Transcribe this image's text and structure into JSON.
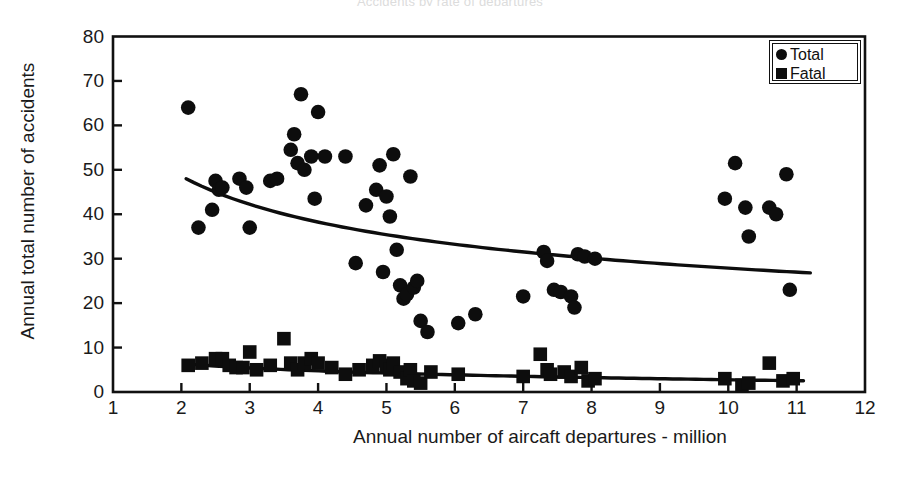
{
  "figure": {
    "ghost_title": "Accidents by rate of departures",
    "background": "#ffffff",
    "ink": "#111111"
  },
  "legend": {
    "position": "top-right",
    "entries": [
      {
        "label": "Total",
        "marker": "circle",
        "color": "#0d0d0d"
      },
      {
        "label": "Fatal",
        "marker": "square",
        "color": "#0d0d0d"
      }
    ]
  },
  "chart_data": {
    "type": "scatter",
    "title": "",
    "xlabel": "Annual number of aircaft departures - million",
    "ylabel": "Annual total number of accidents",
    "xlim": [
      1,
      12
    ],
    "ylim": [
      0,
      80
    ],
    "xticks": [
      1,
      2,
      3,
      4,
      5,
      6,
      7,
      8,
      9,
      10,
      11,
      12
    ],
    "yticks": [
      0,
      10,
      20,
      30,
      40,
      50,
      60,
      70,
      80
    ],
    "grid": false,
    "legend_position": "top-right",
    "series": [
      {
        "name": "Total",
        "marker": "circle",
        "color": "#0d0d0d",
        "points": [
          [
            2.1,
            64.0
          ],
          [
            2.25,
            37.0
          ],
          [
            2.5,
            47.5
          ],
          [
            2.55,
            45.5
          ],
          [
            2.6,
            46.0
          ],
          [
            2.45,
            41.0
          ],
          [
            2.85,
            48.0
          ],
          [
            2.95,
            46.0
          ],
          [
            3.0,
            37.0
          ],
          [
            3.3,
            47.5
          ],
          [
            3.4,
            48.0
          ],
          [
            3.6,
            54.5
          ],
          [
            3.65,
            58.0
          ],
          [
            3.7,
            51.5
          ],
          [
            3.75,
            67.0
          ],
          [
            3.8,
            50.0
          ],
          [
            3.9,
            53.0
          ],
          [
            3.95,
            43.5
          ],
          [
            4.0,
            63.0
          ],
          [
            4.1,
            53.0
          ],
          [
            4.4,
            53.0
          ],
          [
            4.55,
            29.0
          ],
          [
            4.7,
            42.0
          ],
          [
            4.85,
            45.5
          ],
          [
            4.9,
            51.0
          ],
          [
            4.95,
            27.0
          ],
          [
            5.0,
            44.0
          ],
          [
            5.05,
            39.5
          ],
          [
            5.1,
            53.5
          ],
          [
            5.15,
            32.0
          ],
          [
            5.2,
            24.0
          ],
          [
            5.25,
            21.0
          ],
          [
            5.3,
            22.0
          ],
          [
            5.35,
            48.5
          ],
          [
            5.4,
            23.5
          ],
          [
            5.45,
            25.0
          ],
          [
            5.5,
            16.0
          ],
          [
            5.6,
            13.5
          ],
          [
            6.05,
            15.5
          ],
          [
            6.3,
            17.5
          ],
          [
            7.0,
            21.5
          ],
          [
            7.3,
            31.5
          ],
          [
            7.35,
            29.5
          ],
          [
            7.45,
            23.0
          ],
          [
            7.55,
            22.5
          ],
          [
            7.7,
            21.5
          ],
          [
            7.75,
            19.0
          ],
          [
            7.8,
            31.0
          ],
          [
            7.9,
            30.5
          ],
          [
            8.05,
            30.0
          ],
          [
            9.95,
            43.5
          ],
          [
            10.1,
            51.5
          ],
          [
            10.25,
            41.5
          ],
          [
            10.3,
            35.0
          ],
          [
            10.6,
            41.5
          ],
          [
            10.7,
            40.0
          ],
          [
            10.85,
            49.0
          ],
          [
            10.9,
            23.0
          ]
        ]
      },
      {
        "name": "Fatal",
        "marker": "square",
        "color": "#0d0d0d",
        "points": [
          [
            2.1,
            6.0
          ],
          [
            2.3,
            6.5
          ],
          [
            2.5,
            7.5
          ],
          [
            2.6,
            7.5
          ],
          [
            2.7,
            6.0
          ],
          [
            2.8,
            5.5
          ],
          [
            2.9,
            5.5
          ],
          [
            3.0,
            9.0
          ],
          [
            3.1,
            5.0
          ],
          [
            3.3,
            6.0
          ],
          [
            3.5,
            12.0
          ],
          [
            3.6,
            6.5
          ],
          [
            3.7,
            5.0
          ],
          [
            3.8,
            6.5
          ],
          [
            3.9,
            7.5
          ],
          [
            4.0,
            6.5
          ],
          [
            4.2,
            5.5
          ],
          [
            4.4,
            4.0
          ],
          [
            4.6,
            5.0
          ],
          [
            4.8,
            6.0
          ],
          [
            4.9,
            7.0
          ],
          [
            5.0,
            6.0
          ],
          [
            5.05,
            5.0
          ],
          [
            5.1,
            6.5
          ],
          [
            5.2,
            4.5
          ],
          [
            5.3,
            3.0
          ],
          [
            5.35,
            5.0
          ],
          [
            5.4,
            2.5
          ],
          [
            5.5,
            2.0
          ],
          [
            5.65,
            4.5
          ],
          [
            6.05,
            4.0
          ],
          [
            7.0,
            3.5
          ],
          [
            7.25,
            8.5
          ],
          [
            7.35,
            5.0
          ],
          [
            7.4,
            4.0
          ],
          [
            7.6,
            4.5
          ],
          [
            7.7,
            3.5
          ],
          [
            7.85,
            5.5
          ],
          [
            7.95,
            2.5
          ],
          [
            8.05,
            3.0
          ],
          [
            9.95,
            3.0
          ],
          [
            10.2,
            1.5
          ],
          [
            10.3,
            2.0
          ],
          [
            10.6,
            6.5
          ],
          [
            10.8,
            2.5
          ],
          [
            10.95,
            3.0
          ]
        ]
      }
    ],
    "trendlines": [
      {
        "name": "Total trend",
        "x_start": 2.07,
        "x_end": 11.2,
        "y_start": 48.0,
        "y_end": 26.8,
        "curvature": "power-decay"
      },
      {
        "name": "Fatal trend",
        "x_start": 2.1,
        "x_end": 11.1,
        "y_start": 6.3,
        "y_end": 2.6,
        "curvature": "near-linear"
      }
    ]
  }
}
